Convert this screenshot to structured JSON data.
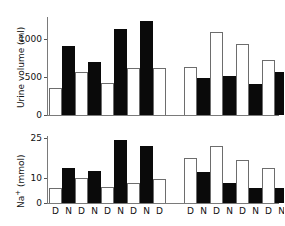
{
  "chart_data": {
    "type": "bar",
    "title": "",
    "panels": [
      {
        "id": "urine-volume",
        "ylabel": "Urine volume (ml)",
        "yticks": [
          0,
          500,
          1000
        ],
        "ylim": [
          0,
          1500
        ],
        "ytick_labels": [
          "0",
          "500",
          "1000"
        ],
        "grid": false,
        "legend": "none",
        "groups": [
          {
            "name": "group-left",
            "categories": [
              "D",
              "N",
              "D",
              "N",
              "D",
              "N",
              "D",
              "N",
              "D"
            ],
            "values": [
              410,
              1030,
              640,
              800,
              480,
              1290,
              700,
              1410,
              700
            ],
            "fills": [
              "white",
              "black",
              "white",
              "black",
              "white",
              "black",
              "white",
              "black",
              "white"
            ]
          },
          {
            "name": "group-right",
            "categories": [
              "D",
              "N",
              "D",
              "N",
              "D",
              "N",
              "D",
              "N"
            ],
            "values": [
              720,
              560,
              1250,
              580,
              1070,
              470,
              830,
              650
            ],
            "fills": [
              "white",
              "black",
              "white",
              "black",
              "white",
              "black",
              "white",
              "black"
            ]
          }
        ]
      },
      {
        "id": "sodium",
        "ylabel": "Na+ (mmol)",
        "ylabel_base": "Na",
        "ylabel_sup": "+",
        "ylabel_rest": " (mmol)",
        "yticks": [
          0,
          10,
          25
        ],
        "ylim": [
          0,
          27
        ],
        "ytick_labels": [
          "0",
          "10",
          "25"
        ],
        "grid": false,
        "legend": "none",
        "groups": [
          {
            "name": "group-left",
            "categories": [
              "D",
              "N",
              "D",
              "N",
              "D",
              "N",
              "D",
              "N",
              "D"
            ],
            "values": [
              6,
              14,
              10,
              13,
              6.5,
              25.5,
              8,
              23,
              9.5
            ],
            "fills": [
              "white",
              "black",
              "white",
              "black",
              "white",
              "black",
              "white",
              "black",
              "white"
            ]
          },
          {
            "name": "group-right",
            "categories": [
              "D",
              "N",
              "D",
              "N",
              "D",
              "N",
              "D",
              "N"
            ],
            "values": [
              18,
              12.5,
              23,
              8,
              17.5,
              6,
              14,
              6
            ],
            "fills": [
              "white",
              "black",
              "white",
              "black",
              "white",
              "black",
              "white",
              "black"
            ]
          }
        ]
      }
    ],
    "xlabel": "",
    "colors": {
      "bar_black": "#0a0a0a",
      "bar_white": "#ffffff",
      "bar_outline": "#6d6d6d",
      "axis": "#7a7a7a",
      "text": "#111111"
    }
  }
}
